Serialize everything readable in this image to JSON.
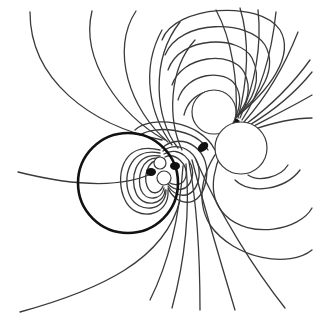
{
  "figure": {
    "type": "field-line diagram",
    "background": "#ffffff",
    "line_color": "#3a3a3a",
    "bold_circle": {
      "cx": 128,
      "cy": 183,
      "r": 50,
      "stroke": "#111111"
    },
    "small_dipole": {
      "center": [
        160,
        170
      ],
      "poles": [
        {
          "cx": 160,
          "cy": 163,
          "r": 6
        },
        {
          "cx": 164,
          "cy": 178,
          "r": 7
        }
      ]
    },
    "large_dipole": {
      "center": [
        232,
        125
      ],
      "poles": [
        {
          "cx": 214,
          "cy": 112,
          "r": 22
        },
        {
          "cx": 240,
          "cy": 148,
          "r": 26
        }
      ]
    }
  }
}
